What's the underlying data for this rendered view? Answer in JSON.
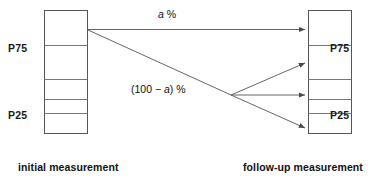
{
  "diagram": {
    "title_present": false,
    "left_box": {
      "name": "initial measurement",
      "caption": "initial measurement",
      "cells": 5,
      "labels": [
        {
          "text": "P75",
          "side": "left"
        },
        {
          "text": "P25",
          "side": "left"
        }
      ]
    },
    "right_box": {
      "name": "follow-up measurement",
      "caption": "follow-up measurement",
      "cells": 5,
      "labels": [
        {
          "text": "P75",
          "side": "right"
        },
        {
          "text": "P25",
          "side": "right"
        }
      ]
    },
    "edge_labels": {
      "top": "a %",
      "top_italic_part": "a",
      "top_suffix": " %",
      "bottom_prefix": "(100 − ",
      "bottom_italic_part": "a",
      "bottom_suffix": ") %"
    },
    "arrows": [
      {
        "id": "arrow-top",
        "label": "a %"
      },
      {
        "id": "arrow-branch-up",
        "label": "(100 − a) %"
      },
      {
        "id": "arrow-branch-mid",
        "label": "(100 − a) %"
      },
      {
        "id": "arrow-branch-down",
        "label": "(100 − a) %"
      }
    ],
    "colors": {
      "box_stroke": "#555555",
      "divider_stroke": "#777777",
      "arrow_stroke": "#555555",
      "text": "#111111",
      "background": "#ffffff"
    }
  }
}
